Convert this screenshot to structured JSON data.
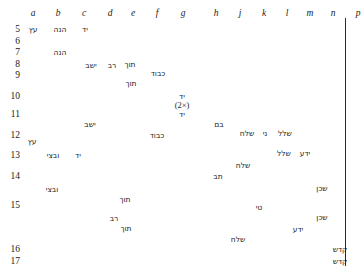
{
  "chart_data": {
    "type": "scatter",
    "title": "",
    "subtitle": "",
    "xlabel": "",
    "ylabel": "",
    "grid": false,
    "legend_position": "none",
    "x_axis_position": "top",
    "y_axis_position": "left",
    "categories": [
      "a",
      "b",
      "c",
      "d",
      "e",
      "f",
      "g",
      "h",
      "j",
      "k",
      "l",
      "m",
      "n",
      "p",
      "q"
    ],
    "row_labels": [
      "5",
      "6",
      "7",
      "8",
      "9",
      "10",
      "11",
      "12",
      "13",
      "14",
      "15",
      "16",
      "17"
    ],
    "points": [
      {
        "col": "a",
        "row": "5",
        "label": "עץ",
        "x": 33,
        "y": 29
      },
      {
        "col": "b",
        "row": "5",
        "label": "הנה",
        "x": 60,
        "y": 29
      },
      {
        "col": "c",
        "row": "5",
        "label": "יד",
        "x": 85,
        "y": 29
      },
      {
        "col": "b",
        "row": "7",
        "label": "הנה",
        "x": 60,
        "y": 52
      },
      {
        "col": "f",
        "row": "8",
        "label": "תוך",
        "x": 130,
        "y": 64
      },
      {
        "col": "e",
        "row": "8",
        "label": "רב",
        "x": 112,
        "y": 65
      },
      {
        "col": "d",
        "row": "8",
        "label": "ישב",
        "x": 91,
        "y": 65
      },
      {
        "col": "g",
        "row": "9",
        "label": "כבוד",
        "x": 158,
        "y": 73
      },
      {
        "col": "f",
        "row": "9",
        "label": "תוך",
        "x": 131,
        "y": 83
      },
      {
        "col": "h",
        "row": "10",
        "label": "יד",
        "x": 182,
        "y": 96
      },
      {
        "col": "h",
        "row": "10",
        "label": "(2×)",
        "x": 182,
        "y": 105,
        "annotation": true
      },
      {
        "col": "h",
        "row": "11",
        "label": "יד",
        "x": 182,
        "y": 114
      },
      {
        "col": "d",
        "row": "11",
        "label": "ישב",
        "x": 90,
        "y": 124
      },
      {
        "col": "k",
        "row": "11",
        "label": "בם",
        "x": 219,
        "y": 124
      },
      {
        "col": "g",
        "row": "12",
        "label": "כבוד",
        "x": 157,
        "y": 135
      },
      {
        "col": "l",
        "row": "12",
        "label": "שלח",
        "x": 247,
        "y": 133
      },
      {
        "col": "m",
        "row": "12",
        "label": "ני",
        "x": 265,
        "y": 133
      },
      {
        "col": "n",
        "row": "12",
        "label": "שלל",
        "x": 285,
        "y": 133
      },
      {
        "col": "a",
        "row": "12",
        "label": "עץ",
        "x": 32,
        "y": 141
      },
      {
        "col": "b",
        "row": "13",
        "label": "ובצי",
        "x": 53,
        "y": 155
      },
      {
        "col": "c",
        "row": "13",
        "label": "יד",
        "x": 78,
        "y": 155
      },
      {
        "col": "n",
        "row": "13",
        "label": "שלל",
        "x": 284,
        "y": 153
      },
      {
        "col": "m",
        "row": "13",
        "label": "ידע",
        "x": 305,
        "y": 153
      },
      {
        "col": "l",
        "row": "13",
        "label": "שלח",
        "x": 243,
        "y": 165
      },
      {
        "col": "k",
        "row": "14",
        "label": "תב",
        "x": 218,
        "y": 176
      },
      {
        "col": "b",
        "row": "14",
        "label": "ובצי",
        "x": 52,
        "y": 189
      },
      {
        "col": "q",
        "row": "14",
        "label": "שכן",
        "x": 322,
        "y": 188
      },
      {
        "col": "f",
        "row": "15",
        "label": "תוך",
        "x": 125,
        "y": 199
      },
      {
        "col": "m",
        "row": "15",
        "label": "טי",
        "x": 259,
        "y": 207
      },
      {
        "col": "q",
        "row": "15",
        "label": "שכן",
        "x": 322,
        "y": 217
      },
      {
        "col": "e",
        "row": "15",
        "label": "רב",
        "x": 114,
        "y": 218
      },
      {
        "col": "f",
        "row": "15",
        "label": "תוך",
        "x": 126,
        "y": 228
      },
      {
        "col": "n",
        "row": "15",
        "label": "ידע",
        "x": 298,
        "y": 229
      },
      {
        "col": "k",
        "row": "15",
        "label": "שלח",
        "x": 238,
        "y": 239
      },
      {
        "col": "q",
        "row": "16",
        "label": "קדש",
        "x": 340,
        "y": 249
      },
      {
        "col": "q",
        "row": "17",
        "label": "קדש",
        "x": 340,
        "y": 261
      }
    ],
    "column_positions": {
      "a": 33,
      "b": 58,
      "c": 84,
      "d": 110,
      "e": 133,
      "f": 157,
      "g": 183,
      "h": 216,
      "j": 240,
      "k": 264,
      "l": 287,
      "m": 310,
      "n": 333,
      "p": 358,
      "q": 381
    },
    "row_positions": {
      "5": 29,
      "6": 41,
      "7": 52,
      "8": 64,
      "9": 75,
      "10": 96,
      "11": 114,
      "12": 135,
      "13": 155,
      "14": 176,
      "15": 205,
      "16": 249,
      "17": 261
    }
  },
  "axes": {
    "columns": [
      {
        "label": "a",
        "x": 33
      },
      {
        "label": "b",
        "x": 58
      },
      {
        "label": "c",
        "x": 84
      },
      {
        "label": "d",
        "x": 110
      },
      {
        "label": "e",
        "x": 133
      },
      {
        "label": "f",
        "x": 157
      },
      {
        "label": "g",
        "x": 183
      },
      {
        "label": "h",
        "x": 216
      },
      {
        "label": "j",
        "x": 240
      },
      {
        "label": "k",
        "x": 264
      },
      {
        "label": "l",
        "x": 287
      },
      {
        "label": "m",
        "x": 310
      },
      {
        "label": "n",
        "x": 333
      },
      {
        "label": "p",
        "x": 358
      },
      {
        "label": "q",
        "x": 381
      }
    ],
    "rows": [
      {
        "label": "5",
        "y": 29
      },
      {
        "label": "6",
        "y": 41
      },
      {
        "label": "7",
        "y": 52
      },
      {
        "label": "8",
        "y": 64
      },
      {
        "label": "9",
        "y": 75
      },
      {
        "label": "10",
        "y": 96
      },
      {
        "label": "11",
        "y": 114
      },
      {
        "label": "12",
        "y": 135
      },
      {
        "label": "13",
        "y": 155
      },
      {
        "label": "14",
        "y": 176
      },
      {
        "label": "15",
        "y": 205
      },
      {
        "label": "16",
        "y": 249
      },
      {
        "label": "17",
        "y": 261
      }
    ]
  },
  "colors": {
    "text": "#1b1b1b",
    "rule": "#2a2a2a",
    "background": "#ffffff"
  }
}
